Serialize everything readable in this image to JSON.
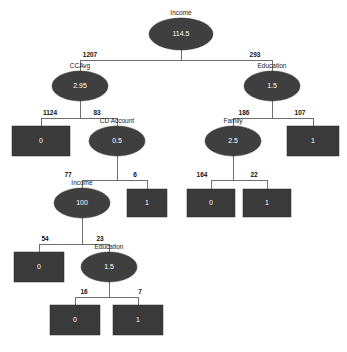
{
  "diagram": {
    "type": "decision-tree",
    "title": "",
    "palette": {
      "decision_node_fill": "#3f3f3f",
      "leaf_node_fill": "#3a3a3a",
      "node_text": "#ffffff",
      "caption_text": "#1a1a1a",
      "edge_stroke": "#6e6e6e",
      "background": "#ffffff"
    },
    "nodes": [
      {
        "id": "n0",
        "kind": "decision",
        "caption": "Income",
        "value": "114.5",
        "cx": 181,
        "cy": 34,
        "rx": 32,
        "ry": 16
      },
      {
        "id": "n1",
        "kind": "decision",
        "caption": "CCAvg",
        "value": "2.95",
        "cx": 80,
        "cy": 86,
        "rx": 28,
        "ry": 15
      },
      {
        "id": "n2",
        "kind": "decision",
        "caption": "Education",
        "value": "1.5",
        "cx": 272,
        "cy": 86,
        "rx": 28,
        "ry": 15
      },
      {
        "id": "n3",
        "kind": "leaf",
        "caption": "",
        "value": "0",
        "x": 12,
        "y": 126,
        "w": 58,
        "h": 30
      },
      {
        "id": "n4",
        "kind": "decision",
        "caption": "CD Account",
        "value": "0.5",
        "cx": 117,
        "cy": 141,
        "rx": 28,
        "ry": 15
      },
      {
        "id": "n5",
        "kind": "decision",
        "caption": "Family",
        "value": "2.5",
        "cx": 233,
        "cy": 141,
        "rx": 28,
        "ry": 15
      },
      {
        "id": "n6",
        "kind": "leaf",
        "caption": "",
        "value": "1",
        "x": 287,
        "y": 126,
        "w": 52,
        "h": 30
      },
      {
        "id": "n7",
        "kind": "decision",
        "caption": "Income",
        "value": "100",
        "cx": 82,
        "cy": 203,
        "rx": 28,
        "ry": 15
      },
      {
        "id": "n8",
        "kind": "leaf",
        "caption": "",
        "value": "1",
        "x": 127,
        "y": 189,
        "w": 40,
        "h": 28
      },
      {
        "id": "n9",
        "kind": "leaf",
        "caption": "",
        "value": "0",
        "x": 187,
        "y": 189,
        "w": 48,
        "h": 28
      },
      {
        "id": "n10",
        "kind": "leaf",
        "caption": "",
        "value": "1",
        "x": 243,
        "y": 189,
        "w": 48,
        "h": 28
      },
      {
        "id": "n11",
        "kind": "leaf",
        "caption": "",
        "value": "0",
        "x": 14,
        "y": 252,
        "w": 50,
        "h": 30
      },
      {
        "id": "n12",
        "kind": "decision",
        "caption": "Education",
        "value": "1.5",
        "cx": 109,
        "cy": 267,
        "rx": 28,
        "ry": 15
      },
      {
        "id": "n13",
        "kind": "leaf",
        "caption": "",
        "value": "0",
        "x": 50,
        "y": 305,
        "w": 50,
        "h": 30
      },
      {
        "id": "n14",
        "kind": "leaf",
        "caption": "",
        "value": "1",
        "x": 113,
        "y": 305,
        "w": 50,
        "h": 30
      }
    ],
    "edges": [
      {
        "from": "n0",
        "to": "n1",
        "label": "1207",
        "label_x": 90,
        "label_y": 57
      },
      {
        "from": "n0",
        "to": "n2",
        "label": "293",
        "label_x": 255,
        "label_y": 57
      },
      {
        "from": "n1",
        "to": "n3",
        "label": "1124",
        "label_x": 50,
        "label_y": 115
      },
      {
        "from": "n1",
        "to": "n4",
        "label": "83",
        "label_x": 97,
        "label_y": 115
      },
      {
        "from": "n2",
        "to": "n5",
        "label": "186",
        "label_x": 244,
        "label_y": 115
      },
      {
        "from": "n2",
        "to": "n6",
        "label": "107",
        "label_x": 300,
        "label_y": 115
      },
      {
        "from": "n4",
        "to": "n7",
        "label": "77",
        "label_x": 68,
        "label_y": 177
      },
      {
        "from": "n4",
        "to": "n8",
        "label": "6",
        "label_x": 135,
        "label_y": 177
      },
      {
        "from": "n5",
        "to": "n9",
        "label": "164",
        "label_x": 202,
        "label_y": 177
      },
      {
        "from": "n5",
        "to": "n10",
        "label": "22",
        "label_x": 254,
        "label_y": 177
      },
      {
        "from": "n7",
        "to": "n11",
        "label": "54",
        "label_x": 45,
        "label_y": 241
      },
      {
        "from": "n7",
        "to": "n12",
        "label": "23",
        "label_x": 100,
        "label_y": 241
      },
      {
        "from": "n12",
        "to": "n13",
        "label": "16",
        "label_x": 84,
        "label_y": 294
      },
      {
        "from": "n12",
        "to": "n14",
        "label": "7",
        "label_x": 140,
        "label_y": 294
      }
    ]
  }
}
